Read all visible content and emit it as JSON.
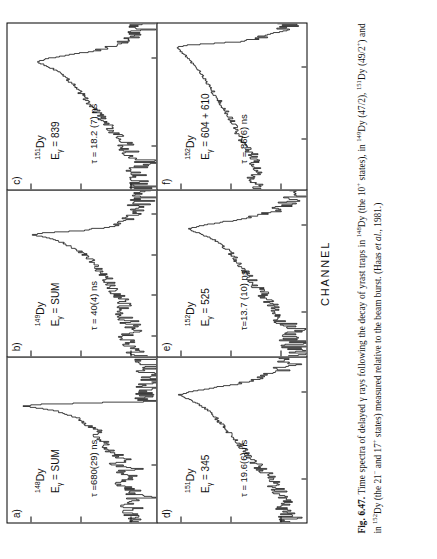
{
  "figure": {
    "axis": {
      "ylabel": "NUMBER OF COUNTS",
      "xlabel": "CHANNEL"
    }
  },
  "caption": {
    "number": "Fig. 6.47.",
    "text_part1": "Time spectra of delayed γ rays following the decay of yrast traps in ",
    "iso1": "148",
    "text_part2": "Dy (the 10",
    "sup1": "+",
    "text_part3": " states), in ",
    "iso2": "149",
    "text_part4": "Dy (47/2), ",
    "iso3": "151",
    "text_part5": "Dy (49/2",
    "sup2": "+",
    "text_part6": ") and in ",
    "iso4": "152",
    "text_part7": "Dy (the 21",
    "sup3": "−",
    "text_part8": " and 17",
    "sup4": "+",
    "text_part9": " states) measured relative to the beam burst. (Haas ",
    "etal": "et al.",
    "text_part10": ", 1981.)"
  },
  "chart_data": [
    {
      "type": "line",
      "panel": "a)",
      "isotope_mass": "148",
      "isotope_symbol": "Dy",
      "gamma_label": "E",
      "gamma_sub": "γ",
      "gamma_value": "= SUM",
      "lifetime": "τ =680(29) ns",
      "title": "",
      "xlabel": "CHANNEL",
      "ylabel": "NUMBER OF COUNTS",
      "yscale": "log",
      "ylim": [
        3,
        3000
      ],
      "yticks": [
        10,
        100,
        1000
      ],
      "ytick_labels": [
        "10",
        "100",
        "1000"
      ],
      "xlim": [
        330,
        530
      ],
      "xticks": [
        400,
        500
      ],
      "xtick_labels": [
        "400",
        "500"
      ],
      "peak_channel": 470,
      "peak_counts": 1700,
      "x": [
        335,
        340,
        345,
        350,
        355,
        360,
        365,
        370,
        375,
        380,
        385,
        390,
        395,
        400,
        405,
        410,
        415,
        420,
        425,
        430,
        435,
        440,
        445,
        450,
        455,
        460,
        465,
        470,
        472,
        474,
        476
      ],
      "values": [
        8,
        12,
        9,
        15,
        11,
        7,
        14,
        9,
        18,
        12,
        8,
        16,
        10,
        22,
        14,
        19,
        26,
        34,
        30,
        45,
        55,
        48,
        70,
        95,
        130,
        200,
        420,
        1700,
        900,
        40,
        5
      ]
    },
    {
      "type": "line",
      "panel": "b)",
      "isotope_mass": "149",
      "isotope_symbol": "Dy",
      "gamma_label": "E",
      "gamma_sub": "γ",
      "gamma_value": "= SUM",
      "lifetime": "τ = 40(4) ns",
      "yscale": "log",
      "ylim": [
        3,
        3000
      ],
      "yticks": [
        10,
        100,
        1000
      ],
      "ytick_labels": [
        "10",
        "100",
        "1000"
      ],
      "xlim": [
        150,
        560
      ],
      "xticks": [
        200,
        300,
        400,
        500
      ],
      "xtick_labels": [
        "200",
        "300",
        "400",
        "500"
      ],
      "peak_channel": 450,
      "peak_counts": 1100,
      "x": [
        160,
        180,
        200,
        220,
        240,
        260,
        280,
        300,
        320,
        340,
        360,
        380,
        400,
        410,
        420,
        430,
        440,
        445,
        450,
        455,
        460,
        470,
        490,
        520,
        550
      ],
      "values": [
        9,
        11,
        14,
        10,
        13,
        16,
        14,
        20,
        25,
        32,
        45,
        60,
        90,
        120,
        170,
        260,
        420,
        650,
        1100,
        600,
        120,
        30,
        12,
        8,
        6
      ]
    },
    {
      "type": "line",
      "panel": "c)",
      "isotope_mass": "151",
      "isotope_symbol": "Dy",
      "gamma_label": "E",
      "gamma_sub": "γ",
      "gamma_value": "= 839",
      "lifetime": "τ = 18.2 (7) ns",
      "yscale": "log",
      "ylim": [
        3,
        3000
      ],
      "yticks": [
        10,
        100,
        1000
      ],
      "ytick_labels": [
        "10",
        "100",
        "1000"
      ],
      "xlim": [
        325,
        420
      ],
      "xticks": [
        350,
        400
      ],
      "xtick_labels": [
        "350",
        "400"
      ],
      "peak_channel": 398,
      "peak_counts": 900,
      "x": [
        330,
        335,
        340,
        345,
        350,
        355,
        360,
        365,
        370,
        375,
        380,
        385,
        390,
        394,
        398,
        400,
        404,
        408,
        412,
        416
      ],
      "values": [
        7,
        9,
        6,
        11,
        14,
        20,
        28,
        40,
        55,
        80,
        110,
        160,
        240,
        420,
        900,
        500,
        60,
        18,
        9,
        7
      ]
    },
    {
      "type": "line",
      "panel": "d)",
      "isotope_mass": "151",
      "isotope_symbol": "Dy",
      "gamma_label": "E",
      "gamma_sub": "γ",
      "gamma_value": "= 345",
      "lifetime": "τ = 19.6(6) ns",
      "yscale": "log",
      "ylim": [
        3,
        3000
      ],
      "yticks": [
        10,
        100,
        1000
      ],
      "ytick_labels": [
        "10",
        "100",
        "1000"
      ],
      "xlim": [
        325,
        420
      ],
      "xticks": [
        350,
        400
      ],
      "xtick_labels": [
        "350",
        "400"
      ],
      "peak_channel": 398,
      "peak_counts": 1300,
      "x": [
        330,
        335,
        340,
        345,
        350,
        355,
        360,
        365,
        370,
        375,
        380,
        385,
        390,
        394,
        398,
        400,
        404,
        408,
        412,
        416
      ],
      "values": [
        8,
        10,
        9,
        13,
        18,
        26,
        38,
        55,
        75,
        110,
        160,
        230,
        360,
        650,
        1300,
        700,
        90,
        25,
        12,
        8
      ]
    },
    {
      "type": "line",
      "panel": "e)",
      "isotope_mass": "152",
      "isotope_symbol": "Dy",
      "gamma_label": "E",
      "gamma_sub": "γ",
      "gamma_value": "= 525",
      "lifetime": "τ=13.7 (10) ns",
      "yscale": "log",
      "ylim": [
        3,
        3000
      ],
      "yticks": [
        10,
        100,
        1000
      ],
      "ytick_labels": [
        "10",
        "100",
        "1000"
      ],
      "xlim": [
        325,
        420
      ],
      "xticks": [
        350,
        400
      ],
      "xtick_labels": [
        "350",
        "400"
      ],
      "peak_channel": 398,
      "peak_counts": 850,
      "x": [
        330,
        335,
        340,
        345,
        350,
        355,
        360,
        365,
        370,
        375,
        380,
        385,
        390,
        394,
        398,
        400,
        404,
        408,
        412,
        416
      ],
      "values": [
        6,
        8,
        7,
        10,
        12,
        17,
        24,
        33,
        46,
        62,
        85,
        120,
        190,
        380,
        850,
        420,
        50,
        16,
        9,
        6
      ]
    },
    {
      "type": "line",
      "panel": "f)",
      "isotope_mass": "152",
      "isotope_symbol": "Dy",
      "gamma_label": "E",
      "gamma_sub": "γ",
      "gamma_value": "= 604 + 610",
      "lifetime": "τ = 86(6) ns",
      "yscale": "log",
      "ylim": [
        3,
        3000
      ],
      "yticks": [
        10,
        100,
        1000
      ],
      "ytick_labels": [
        "10",
        "100",
        "1000"
      ],
      "xlim": [
        60,
        520
      ],
      "xticks": [
        200,
        400
      ],
      "xtick_labels": [
        "200",
        "400"
      ],
      "peak_channel": 455,
      "peak_counts": 1400,
      "x": [
        70,
        90,
        110,
        130,
        150,
        170,
        190,
        210,
        240,
        270,
        300,
        330,
        360,
        390,
        410,
        430,
        445,
        455,
        460,
        470,
        490,
        510
      ],
      "values": [
        30,
        45,
        28,
        40,
        35,
        50,
        60,
        75,
        95,
        130,
        180,
        260,
        360,
        520,
        700,
        950,
        1250,
        1400,
        800,
        60,
        15,
        9
      ]
    }
  ]
}
